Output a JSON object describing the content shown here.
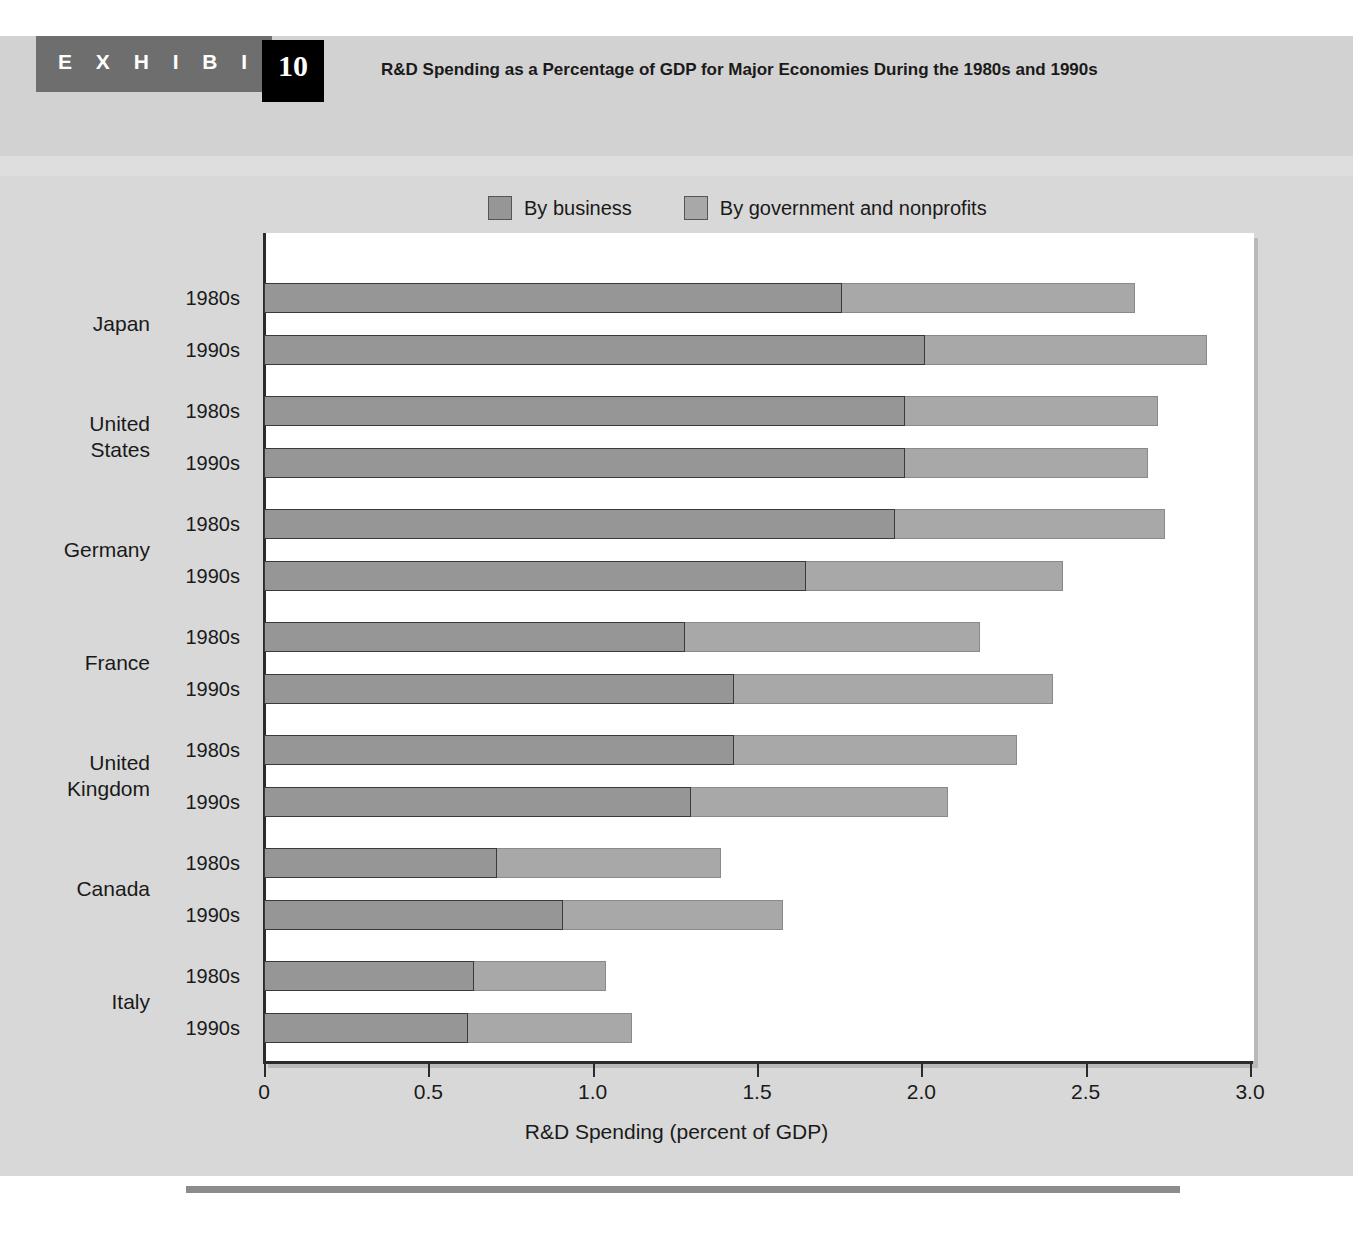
{
  "header": {
    "exhibit_word": "E X H I B I T",
    "exhibit_number": "10",
    "title": "R&D Spending as a Percentage of GDP for Major Economies During the 1980s and 1990s"
  },
  "colors": {
    "business": "#969696",
    "government": "#a8a8a8",
    "band": "#d2d2d2",
    "tab": "#6e6e6e",
    "number_box": "#000000",
    "plot_bg": "#ffffff",
    "chart_bg": "#d8d8d8"
  },
  "chart_data": {
    "type": "bar",
    "orientation": "horizontal",
    "stacked": true,
    "title": "R&D Spending as a Percentage of GDP for Major Economies During the 1980s and 1990s",
    "xlabel": "R&D Spending (percent of GDP)",
    "ylabel": "",
    "xlim": [
      0,
      3.0
    ],
    "xticks": [
      "0",
      "0.5",
      "1.0",
      "1.5",
      "2.0",
      "2.5",
      "3.0"
    ],
    "xtick_values": [
      0,
      0.5,
      1.0,
      1.5,
      2.0,
      2.5,
      3.0
    ],
    "grid": false,
    "legend_position": "top",
    "legend": [
      "By business",
      "By government and nonprofits"
    ],
    "series": [
      {
        "name": "By business",
        "color": "#969696"
      },
      {
        "name": "By government and nonprofits",
        "color": "#a8a8a8"
      }
    ],
    "groups": [
      {
        "country": "Japan",
        "rows": [
          {
            "decade": "1980s",
            "business": 1.76,
            "government": 0.89,
            "total": 2.65
          },
          {
            "decade": "1990s",
            "business": 2.01,
            "government": 0.86,
            "total": 2.87
          }
        ]
      },
      {
        "country": "United States",
        "rows": [
          {
            "decade": "1980s",
            "business": 1.95,
            "government": 0.77,
            "total": 2.72
          },
          {
            "decade": "1990s",
            "business": 1.95,
            "government": 0.74,
            "total": 2.69
          }
        ]
      },
      {
        "country": "Germany",
        "rows": [
          {
            "decade": "1980s",
            "business": 1.92,
            "government": 0.82,
            "total": 2.74
          },
          {
            "decade": "1990s",
            "business": 1.65,
            "government": 0.78,
            "total": 2.43
          }
        ]
      },
      {
        "country": "France",
        "rows": [
          {
            "decade": "1980s",
            "business": 1.28,
            "government": 0.9,
            "total": 2.18
          },
          {
            "decade": "1990s",
            "business": 1.43,
            "government": 0.97,
            "total": 2.4
          }
        ]
      },
      {
        "country": "United Kingdom",
        "rows": [
          {
            "decade": "1980s",
            "business": 1.43,
            "government": 0.86,
            "total": 2.29
          },
          {
            "decade": "1990s",
            "business": 1.3,
            "government": 0.78,
            "total": 2.08
          }
        ]
      },
      {
        "country": "Canada",
        "rows": [
          {
            "decade": "1980s",
            "business": 0.71,
            "government": 0.68,
            "total": 1.39
          },
          {
            "decade": "1990s",
            "business": 0.91,
            "government": 0.67,
            "total": 1.58
          }
        ]
      },
      {
        "country": "Italy",
        "rows": [
          {
            "decade": "1980s",
            "business": 0.64,
            "government": 0.4,
            "total": 1.04
          },
          {
            "decade": "1990s",
            "business": 0.62,
            "government": 0.5,
            "total": 1.12
          }
        ]
      }
    ]
  }
}
